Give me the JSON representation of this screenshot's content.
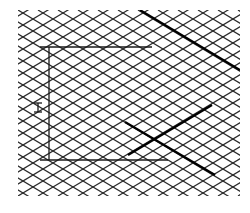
{
  "diagram": {
    "type": "isometric-grid-drawing",
    "background": "#ffffff",
    "grid": {
      "color": "#2a2a2a",
      "line_width": 1.2,
      "cell_width": 20,
      "cell_height": 12,
      "left": 18,
      "top": 10,
      "right": 240,
      "bottom": 196
    },
    "frame": {
      "color": "#1a1a1a",
      "top_line": {
        "x1": 40,
        "y1": 47,
        "x2": 152,
        "y2": 47
      },
      "vertical_line": {
        "x1": 49,
        "y1": 47,
        "x2": 49,
        "y2": 160
      },
      "bottom_line": {
        "x1": 40,
        "y1": 160,
        "x2": 168,
        "y2": 160
      }
    },
    "dimension_marker": {
      "label": "H",
      "x": 38,
      "y_top": 103,
      "y_bottom": 112
    },
    "heavy_lines": [
      {
        "x1": 140,
        "y1": 10,
        "x2": 240,
        "y2": 70
      },
      {
        "x1": 128,
        "y1": 155,
        "x2": 212,
        "y2": 105
      },
      {
        "x1": 125,
        "y1": 122,
        "x2": 215,
        "y2": 175
      }
    ]
  }
}
